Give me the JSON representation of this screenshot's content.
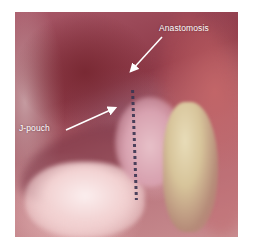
{
  "figure": {
    "type": "laparoscopic surgical photograph",
    "annotations": [
      {
        "id": "anastomosis",
        "label": "Anastomosis",
        "color": "#ffffff"
      },
      {
        "id": "j-pouch",
        "label": "J-pouch",
        "color": "#ffffff"
      }
    ]
  },
  "colors": {
    "background": "#ffffff",
    "tissue_dark": "#8e3a48",
    "tissue_light": "#f2d2d2",
    "fat": "#d7c49a",
    "suture": "#3a3450",
    "annotation": "#ffffff"
  }
}
